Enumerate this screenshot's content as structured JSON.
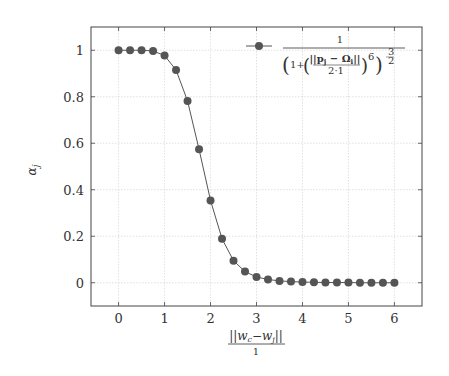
{
  "chart_data": {
    "type": "line",
    "title": "",
    "xlabel": "||w_c − w_j|| / 1",
    "xlabel_numerator": "||w",
    "xlabel_denominator": "1",
    "ylabel": "α_j",
    "xlim": [
      -0.6,
      6.6
    ],
    "ylim": [
      -0.1,
      1.1
    ],
    "xticks": [
      0,
      1,
      2,
      3,
      4,
      5,
      6
    ],
    "yticks": [
      0,
      0.2,
      0.4,
      0.6,
      0.8,
      1
    ],
    "ytick_labels": [
      "0",
      "0.2",
      "0.4",
      "0.6",
      "0.8",
      "1"
    ],
    "grid": true,
    "legend_position": "top-right",
    "series": [
      {
        "name": "1 / (1 + (||p_j − Ω_i|| / (2·1))^6)^(3/2)",
        "color": "#555555",
        "marker": "circle",
        "x": [
          0,
          0.25,
          0.5,
          0.75,
          1.0,
          1.25,
          1.5,
          1.75,
          2.0,
          2.25,
          2.5,
          2.75,
          3.0,
          3.25,
          3.5,
          3.75,
          4.0,
          4.25,
          4.5,
          4.75,
          5.0,
          5.25,
          5.5,
          5.75,
          6.0
        ],
        "y": [
          1.0,
          1.0,
          1.0,
          0.997,
          0.977,
          0.915,
          0.782,
          0.574,
          0.354,
          0.189,
          0.095,
          0.048,
          0.025,
          0.014,
          0.008,
          0.005,
          0.003,
          0.002,
          0.001,
          0.001,
          0.001,
          0.0,
          0.0,
          0.0,
          0.0
        ]
      }
    ]
  },
  "legend": {
    "numerator": "1",
    "inner_num": "||p",
    "inner_sub": "j",
    "inner_mid": " − Ω",
    "inner_sub2": "i",
    "inner_end": "||",
    "inner_den": "2·1",
    "one_plus": "1+",
    "exp6": "6",
    "exp_num": "3",
    "exp_den": "2"
  },
  "axes": {
    "ylabel_main": "α",
    "ylabel_sub": "j",
    "xlabel_num": "||w",
    "xlabel_sub1": "c",
    "xlabel_mid": "−w",
    "xlabel_sub2": "j",
    "xlabel_end": "||",
    "xlabel_den": "1"
  }
}
